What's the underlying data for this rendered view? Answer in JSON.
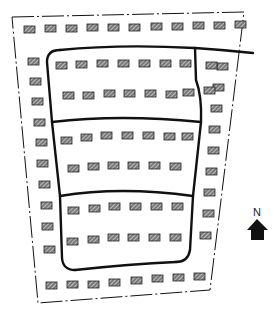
{
  "diagram": {
    "type": "site-plan-sketch",
    "north_label": "N",
    "colors": {
      "background": "#ffffff",
      "line": "#111111",
      "building_fill": "#7a7a7a",
      "building_stroke": "#222222",
      "hatch": "#e8e8e8",
      "arrow": "#111111"
    },
    "boundary": {
      "style": "dash-dot",
      "points": [
        [
          12,
          17
        ],
        [
          244,
          12
        ],
        [
          210,
          290
        ],
        [
          38,
          303
        ]
      ]
    },
    "roads": [
      {
        "name": "top-road",
        "path": "M 60 50 Q 120 44 195 48 Q 225 50 253 53"
      },
      {
        "name": "left-road",
        "path": "M 60 50 Q 47 50 47 62 L 52 122 L 60 196 L 62 258 Q 63 270 75 270"
      },
      {
        "name": "right-road",
        "path": "M 195 48 L 196 80 Q 202 96 201 122 L 193 196 L 190 250 Q 188 262 176 262"
      },
      {
        "name": "bottom-road",
        "path": "M 75 270 Q 130 264 176 262"
      },
      {
        "name": "middle-cross-road-1",
        "path": "M 52 122 Q 120 114 201 122"
      },
      {
        "name": "middle-cross-road-2",
        "path": "M 60 196 Q 120 186 193 196"
      }
    ],
    "building_groups": {
      "top_row": [
        [
          24,
          26
        ],
        [
          45,
          25
        ],
        [
          66,
          25
        ],
        [
          87,
          24
        ],
        [
          108,
          24
        ],
        [
          129,
          24
        ],
        [
          151,
          23
        ],
        [
          172,
          23
        ],
        [
          193,
          22
        ],
        [
          214,
          22
        ],
        [
          235,
          21
        ]
      ],
      "left_column": [
        [
          28,
          58
        ],
        [
          30,
          78
        ],
        [
          32,
          98
        ],
        [
          34,
          119
        ],
        [
          36,
          139
        ],
        [
          37,
          160
        ],
        [
          39,
          181
        ],
        [
          41,
          202
        ],
        [
          42,
          223
        ],
        [
          44,
          246
        ]
      ],
      "right_column": [
        [
          217,
          63
        ],
        [
          213,
          84
        ],
        [
          211,
          105
        ],
        [
          209,
          126
        ],
        [
          208,
          147
        ],
        [
          206,
          168
        ],
        [
          204,
          189
        ],
        [
          203,
          210
        ],
        [
          200,
          232
        ]
      ],
      "bottom_row": [
        [
          46,
          282
        ],
        [
          67,
          281
        ],
        [
          88,
          281
        ],
        [
          109,
          279
        ],
        [
          131,
          277
        ],
        [
          152,
          275
        ],
        [
          173,
          274
        ],
        [
          194,
          273
        ]
      ],
      "block1_row1": [
        [
          56,
          62
        ],
        [
          76,
          61
        ],
        [
          97,
          60
        ],
        [
          118,
          60
        ],
        [
          139,
          60
        ],
        [
          160,
          60
        ],
        [
          180,
          60
        ]
      ],
      "block1_row2": [
        [
          63,
          92
        ],
        [
          83,
          92
        ],
        [
          104,
          90
        ],
        [
          124,
          90
        ],
        [
          145,
          90
        ],
        [
          166,
          91
        ],
        [
          183,
          89
        ]
      ],
      "block1_extra": [
        [
          206,
          62
        ],
        [
          204,
          87
        ]
      ],
      "block2_row1": [
        [
          61,
          137
        ],
        [
          81,
          134
        ],
        [
          101,
          132
        ],
        [
          122,
          132
        ],
        [
          143,
          132
        ],
        [
          164,
          133
        ],
        [
          182,
          133
        ]
      ],
      "block2_row2": [
        [
          68,
          165
        ],
        [
          88,
          163
        ],
        [
          108,
          162
        ],
        [
          128,
          162
        ],
        [
          149,
          162
        ],
        [
          170,
          163
        ]
      ],
      "block3_row1": [
        [
          68,
          207
        ],
        [
          89,
          205
        ],
        [
          109,
          203
        ],
        [
          130,
          203
        ],
        [
          151,
          203
        ],
        [
          172,
          203
        ]
      ],
      "block3_row2": [
        [
          67,
          238
        ],
        [
          88,
          236
        ],
        [
          108,
          234
        ],
        [
          128,
          234
        ],
        [
          149,
          234
        ],
        [
          170,
          234
        ]
      ]
    },
    "building_size": [
      11,
      7
    ],
    "north_arrow": {
      "label_pos": [
        253,
        206
      ],
      "points": [
        [
          257,
          219
        ],
        [
          268,
          230
        ],
        [
          264,
          230
        ],
        [
          264,
          240
        ],
        [
          251,
          240
        ],
        [
          251,
          230
        ],
        [
          247,
          230
        ]
      ]
    }
  }
}
